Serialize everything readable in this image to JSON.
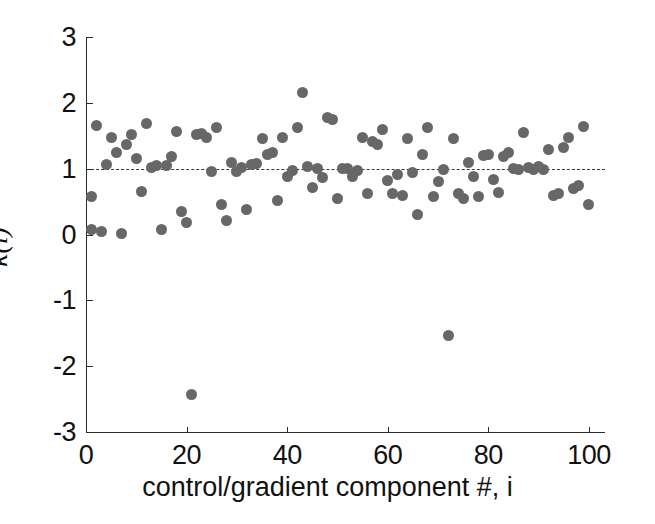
{
  "figure": {
    "width": 655,
    "height": 524,
    "background": "#ffffff",
    "marker_color": "#676767",
    "axis_color": "#2b2b2b",
    "refline_color": "#3a3a3a"
  },
  "chart_data": {
    "type": "scatter",
    "title": "",
    "xlabel": "control/gradient component #, i",
    "ylabel": "κ(i)",
    "xlim": [
      0,
      103
    ],
    "ylim": [
      -3,
      3
    ],
    "xticks": [
      0,
      20,
      40,
      60,
      80,
      100
    ],
    "xticklabels": [
      "0",
      "20",
      "40",
      "60",
      "80",
      "100"
    ],
    "yticks": [
      -3,
      -2,
      -1,
      0,
      1,
      2,
      3
    ],
    "yticklabels": [
      "-3",
      "-2",
      "-1",
      "0",
      "1",
      "2",
      "3"
    ],
    "grid": false,
    "legend": null,
    "annotations": [
      {
        "type": "hline",
        "y": 1,
        "style": "dashed",
        "label": "reference kappa = 1"
      }
    ],
    "series": [
      {
        "name": "kappa(i)",
        "marker": "circle",
        "color": "#676767",
        "x": [
          1,
          1,
          2,
          3,
          4,
          5,
          6,
          7,
          8,
          9,
          10,
          11,
          12,
          13,
          14,
          15,
          16,
          17,
          18,
          19,
          20,
          21,
          22,
          23,
          24,
          25,
          26,
          27,
          28,
          29,
          30,
          31,
          32,
          33,
          34,
          35,
          36,
          37,
          38,
          39,
          40,
          41,
          42,
          43,
          44,
          45,
          46,
          47,
          48,
          49,
          50,
          51,
          52,
          53,
          54,
          55,
          56,
          57,
          58,
          59,
          60,
          61,
          62,
          63,
          64,
          65,
          66,
          67,
          68,
          69,
          70,
          71,
          72,
          73,
          74,
          75,
          76,
          77,
          78,
          79,
          80,
          81,
          82,
          83,
          84,
          85,
          86,
          87,
          88,
          89,
          90,
          91,
          92,
          93,
          94,
          95,
          96,
          97,
          98,
          99,
          100
        ],
        "y": [
          0.57,
          0.07,
          1.66,
          0.04,
          1.07,
          1.47,
          1.25,
          0.02,
          1.37,
          1.52,
          1.15,
          0.65,
          1.68,
          1.02,
          1.05,
          0.07,
          1.05,
          1.19,
          1.57,
          0.35,
          0.18,
          -2.43,
          1.52,
          1.54,
          1.48,
          0.95,
          1.62,
          0.46,
          0.22,
          1.09,
          0.95,
          1.02,
          0.38,
          1.06,
          1.08,
          1.46,
          1.22,
          1.25,
          0.52,
          1.48,
          0.88,
          0.97,
          1.63,
          2.15,
          1.03,
          0.72,
          1.01,
          0.87,
          1.77,
          1.74,
          0.55,
          1.0,
          1.01,
          0.88,
          0.97,
          1.47,
          0.62,
          1.41,
          1.37,
          1.59,
          0.82,
          0.63,
          0.91,
          0.6,
          1.46,
          0.94,
          0.3,
          1.21,
          1.63,
          0.58,
          0.8,
          0.98,
          -1.53,
          1.46,
          0.63,
          0.55,
          1.1,
          0.88,
          0.57,
          1.2,
          1.22,
          0.83,
          0.64,
          1.18,
          1.25,
          1.0,
          0.99,
          1.55,
          1.02,
          0.98,
          1.03,
          0.99,
          1.29,
          0.6,
          0.62,
          1.32,
          1.48,
          0.7,
          0.74,
          1.64,
          0.45
        ]
      }
    ]
  }
}
